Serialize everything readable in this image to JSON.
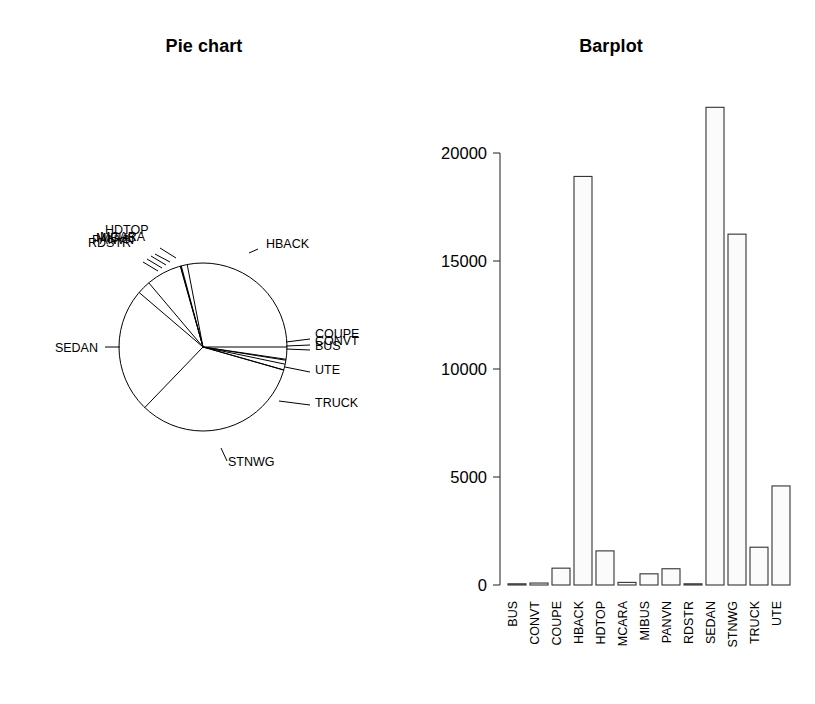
{
  "figure": {
    "width": 815,
    "height": 704,
    "background": "#ffffff",
    "foreground": "#000000"
  },
  "pie_panel": {
    "title": "Pie chart",
    "name": "pie-chart"
  },
  "bar_panel": {
    "title": "Barplot",
    "name": "barplot"
  },
  "chart_data": [
    {
      "type": "pie",
      "title": "Pie chart",
      "labels": [
        "HBACK",
        "COUPE",
        "CONVT",
        "BUS",
        "UTE",
        "TRUCK",
        "STNWG",
        "SEDAN",
        "RDSTR",
        "PANVN",
        "MIBUS",
        "MCARA",
        "HDTOP"
      ],
      "values": [
        18915,
        780,
        91,
        48,
        4586,
        1750,
        16243,
        22115,
        27,
        752,
        517,
        121,
        1579
      ],
      "legend": "none",
      "start_angle_deg": 0,
      "direction": "counterclockwise",
      "xlabel": "",
      "ylabel": ""
    },
    {
      "type": "bar",
      "title": "Barplot",
      "categories": [
        "BUS",
        "CONVT",
        "COUPE",
        "HBACK",
        "HDTOP",
        "MCARA",
        "MIBUS",
        "PANVN",
        "RDSTR",
        "SEDAN",
        "STNWG",
        "TRUCK",
        "UTE"
      ],
      "values": [
        48,
        91,
        780,
        18915,
        1579,
        121,
        517,
        752,
        27,
        22115,
        16243,
        1750,
        4586
      ],
      "yticks": [
        0,
        5000,
        10000,
        15000,
        20000
      ],
      "ytick_labels": [
        "0",
        "5000",
        "10000",
        "15000",
        "20000"
      ],
      "ylim": [
        0,
        22500
      ],
      "xlabel": "",
      "ylabel": "",
      "grid": false,
      "legend": "none",
      "bar_fill": "#fbfbfb",
      "bar_stroke": "#333333"
    }
  ],
  "pie_slices": [
    {
      "label": "HBACK",
      "value": 18915,
      "label_x": 266,
      "label_y": 248,
      "anchor": "start",
      "leader": [
        [
          249,
          253
        ],
        [
          258,
          249
        ]
      ]
    },
    {
      "label": "COUPE",
      "value": 780,
      "label_x": 315,
      "label_y": 338,
      "anchor": "start",
      "leader": [
        [
          286,
          342
        ],
        [
          310,
          339
        ]
      ]
    },
    {
      "label": "CONVT",
      "value": 91,
      "label_x": 315,
      "label_y": 345,
      "anchor": "start",
      "leader": [
        [
          286,
          346
        ],
        [
          310,
          345
        ]
      ]
    },
    {
      "label": "BUS",
      "value": 48,
      "label_x": 315,
      "label_y": 350,
      "anchor": "start",
      "leader": [
        [
          286,
          349
        ],
        [
          310,
          350
        ]
      ]
    },
    {
      "label": "UTE",
      "value": 4586,
      "label_x": 315,
      "label_y": 374,
      "anchor": "start",
      "leader": [
        [
          285,
          367
        ],
        [
          310,
          372
        ]
      ]
    },
    {
      "label": "TRUCK",
      "value": 1750,
      "label_x": 315,
      "label_y": 407,
      "anchor": "start",
      "leader": [
        [
          279,
          401
        ],
        [
          310,
          405
        ]
      ]
    },
    {
      "label": "STNWG",
      "value": 16243,
      "label_x": 228,
      "label_y": 466,
      "anchor": "start",
      "leader": [
        [
          221,
          448
        ],
        [
          227,
          461
        ]
      ]
    },
    {
      "label": "SEDAN",
      "value": 22115,
      "label_x": 98,
      "label_y": 352,
      "anchor": "end",
      "leader": [
        [
          120,
          347
        ],
        [
          105,
          347
        ]
      ]
    },
    {
      "label": "RDSTR",
      "value": 27,
      "label_x": 88,
      "label_y": 247,
      "anchor": "start",
      "leader": [
        [
          158,
          271
        ],
        [
          143,
          262
        ]
      ]
    },
    {
      "label": "PANVN",
      "value": 752,
      "label_x": 92,
      "label_y": 244,
      "anchor": "start",
      "leader": [
        [
          162,
          268
        ],
        [
          147,
          259
        ]
      ]
    },
    {
      "label": "MIBUS",
      "value": 517,
      "label_x": 96,
      "label_y": 242,
      "anchor": "start",
      "leader": [
        [
          166,
          265
        ],
        [
          151,
          256
        ]
      ]
    },
    {
      "label": "MCARA",
      "value": 121,
      "label_x": 100,
      "label_y": 241,
      "anchor": "start",
      "leader": [
        [
          170,
          262
        ],
        [
          155,
          254
        ]
      ]
    },
    {
      "label": "HDTOP",
      "value": 1579,
      "label_x": 105,
      "label_y": 234,
      "anchor": "start",
      "leader": [
        [
          176,
          258
        ],
        [
          160,
          248
        ]
      ]
    }
  ],
  "pie_geometry": {
    "cx": 203,
    "cy": 347,
    "r": 84,
    "note": "slice boundary angles measured counterclockwise from 3 o'clock"
  },
  "bar_geometry": {
    "baseline_y": 585,
    "top_y": 153,
    "top_value": 20000,
    "axis_x": 500,
    "plot_left": 508,
    "plot_right": 795,
    "bar_width": 18,
    "bar_pitch": 22
  }
}
